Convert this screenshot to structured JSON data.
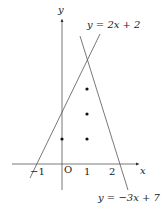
{
  "axes": {
    "x_label": "x",
    "y_label": "y",
    "origin_label": "O",
    "x_ticks": [
      "−1",
      "1",
      "2"
    ]
  },
  "lines": [
    {
      "label": "y = 2x + 2",
      "slope": 2,
      "intercept": 2
    },
    {
      "label": "y = −3x + 7",
      "slope": -3,
      "intercept": 7
    }
  ],
  "points": [
    [
      0,
      1
    ],
    [
      1,
      1
    ],
    [
      1,
      2
    ],
    [
      1,
      3
    ]
  ],
  "colors": {
    "stroke": "#444444",
    "point": "#111111"
  }
}
